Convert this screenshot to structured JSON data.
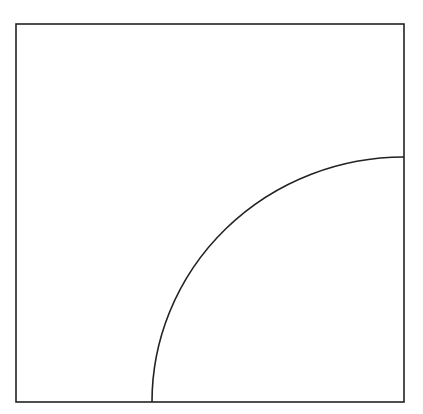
{
  "diagram": {
    "background_color": "#ffffff",
    "stroke_color": "#222222",
    "stroke_width": 1.6,
    "square": {
      "x": 16,
      "y": 24,
      "width": 388,
      "height": 378
    },
    "arc": {
      "center_corner": "bottom-right",
      "start": {
        "x": 152,
        "y": 402
      },
      "end": {
        "x": 404,
        "y": 157
      },
      "radius_x": 252,
      "radius_y": 245
    }
  }
}
